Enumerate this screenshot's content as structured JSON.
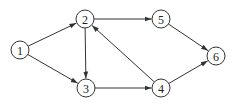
{
  "diagram": {
    "type": "directed-graph",
    "node_radius": 9,
    "stroke_color": "#333333",
    "background": "#ffffff",
    "nodes": [
      {
        "id": "1",
        "label": "1",
        "x": 20,
        "y": 50
      },
      {
        "id": "2",
        "label": "2",
        "x": 85,
        "y": 19
      },
      {
        "id": "3",
        "label": "3",
        "x": 86,
        "y": 88
      },
      {
        "id": "4",
        "label": "4",
        "x": 161,
        "y": 88
      },
      {
        "id": "5",
        "label": "5",
        "x": 161,
        "y": 19
      },
      {
        "id": "6",
        "label": "6",
        "x": 216,
        "y": 56
      }
    ],
    "edges": [
      {
        "from": "1",
        "to": "2"
      },
      {
        "from": "1",
        "to": "3"
      },
      {
        "from": "2",
        "to": "3"
      },
      {
        "from": "2",
        "to": "5"
      },
      {
        "from": "3",
        "to": "4"
      },
      {
        "from": "4",
        "to": "2"
      },
      {
        "from": "4",
        "to": "6"
      },
      {
        "from": "5",
        "to": "6"
      }
    ]
  }
}
